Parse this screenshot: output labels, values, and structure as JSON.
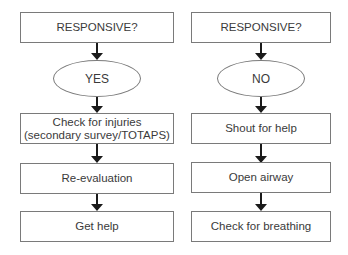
{
  "flowchart": {
    "left": {
      "question": "RESPONSIVE?",
      "answer": "YES",
      "steps": [
        "Check for injuries",
        "(secondary survey/TOTAPS)",
        "Re-evaluation",
        "Get help"
      ]
    },
    "right": {
      "question": "RESPONSIVE?",
      "answer": "NO",
      "steps": [
        "Shout for help",
        "Open airway",
        "Check for breathing"
      ]
    }
  },
  "colors": {
    "border": "#7a7a7a",
    "arrow": "#1a1a1a",
    "text": "#3a3a3a"
  }
}
